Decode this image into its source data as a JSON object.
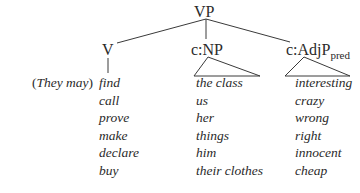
{
  "tree": {
    "root": "VP",
    "children": [
      {
        "label": "V"
      },
      {
        "label": "c:NP"
      },
      {
        "label": "c:AdjP",
        "subscript": "pred"
      }
    ]
  },
  "subject": {
    "open": "(",
    "text": "They may",
    "close": ")"
  },
  "columns": {
    "verbs": [
      "find",
      "call",
      "prove",
      "make",
      "declare",
      "buy"
    ],
    "objects": [
      "the class",
      "us",
      "her",
      "things",
      "him",
      "their clothes"
    ],
    "predicates": [
      "interesting",
      "crazy",
      "wrong",
      "right",
      "innocent",
      "cheap"
    ]
  },
  "colors": {
    "line": "#3a3a3a",
    "text": "#2a2a2a"
  }
}
